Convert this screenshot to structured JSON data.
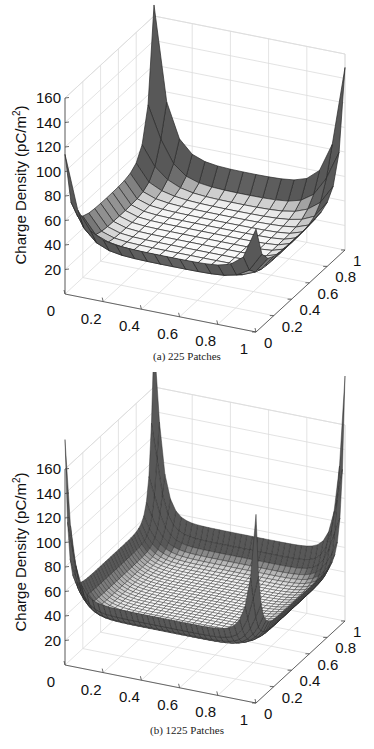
{
  "chart_data": [
    {
      "type": "surface",
      "title": "",
      "caption": "(a)  225 Patches",
      "grid_resolution": 15,
      "xlabel": "",
      "ylabel": "",
      "zlabel": "Charge Density (pC/m²)",
      "x_ticks": [
        "0",
        "0.2",
        "0.4",
        "0.6",
        "0.8",
        "1"
      ],
      "y_ticks": [
        "0",
        "0.2",
        "0.4",
        "0.6",
        "0.8",
        "1"
      ],
      "z_ticks": [
        "20",
        "40",
        "60",
        "80",
        "100",
        "120",
        "140",
        "160"
      ],
      "xlim": [
        0,
        1
      ],
      "ylim": [
        0,
        1
      ],
      "zlim": [
        0,
        160
      ],
      "grid": true,
      "corner_values": {
        "x0_y0": 85,
        "x1_y0": 55,
        "x0_y1": 140,
        "x1_y1": 120
      },
      "edge_midpoint_value": 35,
      "center_value": 30
    },
    {
      "type": "surface",
      "title": "",
      "caption": "(b)  1225 Patches",
      "grid_resolution": 35,
      "xlabel": "",
      "ylabel": "",
      "zlabel": "Charge Density (pC/m²)",
      "x_ticks": [
        "0",
        "0.2",
        "0.4",
        "0.6",
        "0.8",
        "1"
      ],
      "y_ticks": [
        "0",
        "0.2",
        "0.4",
        "0.6",
        "0.8",
        "1"
      ],
      "z_ticks": [
        "20",
        "40",
        "60",
        "80",
        "100",
        "120",
        "140",
        "160"
      ],
      "xlim": [
        0,
        1
      ],
      "ylim": [
        0,
        1
      ],
      "zlim": [
        0,
        160
      ],
      "grid": true,
      "corner_values": {
        "x0_y0": 150,
        "x1_y0": 120,
        "x0_y1": 190,
        "x1_y1": 175
      },
      "edge_midpoint_value": 42,
      "center_value": 32
    }
  ],
  "captions": {
    "a": "(a)  225 Patches",
    "b": "(b)  1225 Patches"
  },
  "zlabel": "Charge Density (pC/m",
  "zlabel_sup": "2",
  "zlabel_end": ")"
}
